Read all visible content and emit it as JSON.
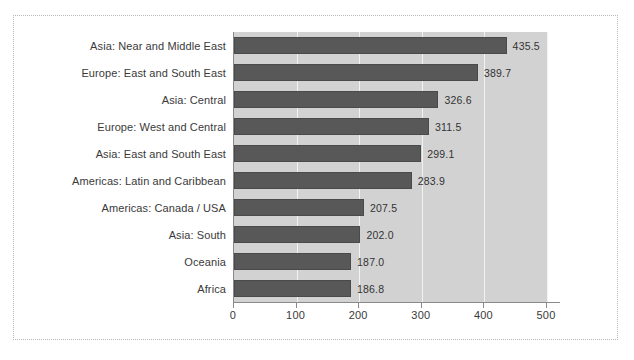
{
  "chart_data": {
    "type": "bar",
    "orientation": "horizontal",
    "title": "",
    "subtitle": "",
    "xlabel": "",
    "ylabel": "",
    "xlim": [
      0,
      500
    ],
    "xticks": [
      0,
      100,
      200,
      300,
      400,
      500
    ],
    "xtick_labels": [
      "0",
      "100",
      "200",
      "300",
      "400",
      "500"
    ],
    "grid": true,
    "grid_axis": "x",
    "legend": false,
    "legend_position": "none",
    "categories": [
      "Asia: Near and Middle East",
      "Europe: East and South East",
      "Asia: Central",
      "Europe: West and Central",
      "Asia: East and South East",
      "Americas: Latin and Caribbean",
      "Americas: Canada / USA",
      "Asia: South",
      "Oceania",
      "Africa"
    ],
    "values": [
      435.5,
      389.7,
      326.6,
      311.5,
      299.1,
      283.9,
      207.5,
      202.0,
      187.0,
      186.8
    ],
    "value_labels": [
      "435.5",
      "389.7",
      "326.6",
      "311.5",
      "299.1",
      "283.9",
      "207.5",
      "202.0",
      "187.0",
      "186.8"
    ],
    "colors": {
      "bar_fill": "#585858",
      "bar_edge": "#4a4a4a",
      "plot_background": "#d2d2d2",
      "gridline": "#f2f2f2",
      "axis_line": "#8a8a8a",
      "text": "#3a3a3a",
      "frame_border": "#b9b9b9",
      "figure_background": "#ffffff"
    }
  }
}
